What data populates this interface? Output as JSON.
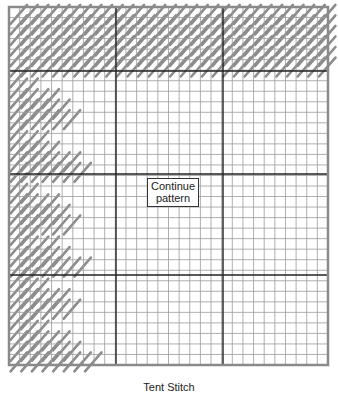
{
  "diagram": {
    "grid": {
      "left": 9,
      "top": 7,
      "right": 328,
      "bottom": 365,
      "cols": 30,
      "rows": 34,
      "major_every": 10,
      "major_cols_x": [
        116,
        223
      ],
      "major_rows_y": [
        71,
        174,
        275
      ],
      "minor_color": "#9a9a9a",
      "major_color": "#222222",
      "border_color": "#8a8a8a"
    },
    "stitch_color": "#8c8c8c",
    "stitch_blocks": [
      {
        "name": "top-band",
        "row_start": 0,
        "row_end": 6,
        "col_start": 0,
        "col_end": 30,
        "shape": "band"
      },
      {
        "name": "triangle-1",
        "row_start": 6,
        "row_end": 11,
        "col_start": 0,
        "col_end": 6,
        "shape": "triangle"
      },
      {
        "name": "triangle-2",
        "row_start": 11,
        "row_end": 16,
        "col_start": 0,
        "col_end": 7,
        "shape": "triangle"
      },
      {
        "name": "triangle-3",
        "row_start": 16,
        "row_end": 21,
        "col_start": 0,
        "col_end": 6,
        "shape": "triangle"
      },
      {
        "name": "triangle-4",
        "row_start": 21,
        "row_end": 25,
        "col_start": 0,
        "col_end": 7,
        "shape": "triangle"
      },
      {
        "name": "triangle-5",
        "row_start": 25,
        "row_end": 29,
        "col_start": 0,
        "col_end": 6,
        "shape": "triangle"
      },
      {
        "name": "triangle-6",
        "row_start": 29,
        "row_end": 34,
        "col_start": 0,
        "col_end": 8,
        "shape": "triangle"
      }
    ],
    "callout": {
      "line1": "Continue",
      "line2": "pattern"
    },
    "caption": "Tent Stitch"
  }
}
